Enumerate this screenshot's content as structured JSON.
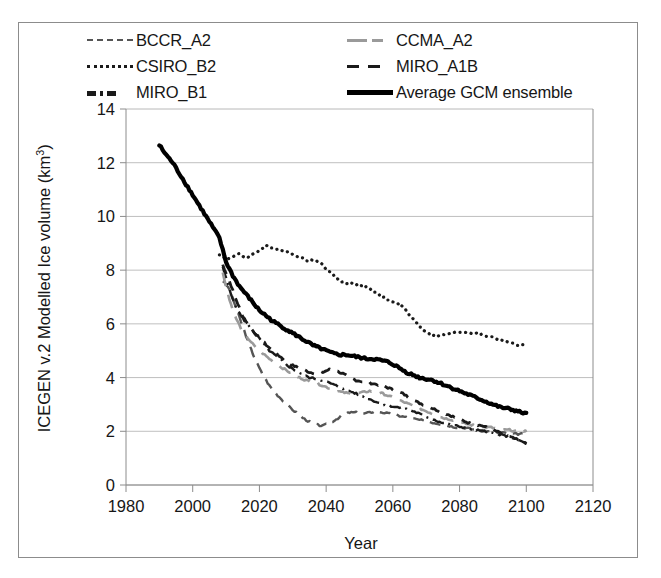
{
  "chart_data": {
    "type": "line",
    "title": "",
    "xlabel": "Year",
    "ylabel": "ICEGEN v.2 Modelled Ice volume (km3)",
    "ylabel_base": "ICEGEN v.2 Modelled Ice volume (km",
    "ylabel_sup": "3",
    "ylabel_close": ")",
    "xlim": [
      1980,
      2120
    ],
    "ylim": [
      0,
      14
    ],
    "xticks": [
      1980,
      2000,
      2020,
      2040,
      2060,
      2080,
      2100,
      2120
    ],
    "yticks": [
      0,
      2,
      4,
      6,
      8,
      10,
      12,
      14
    ],
    "grid": "horizontal",
    "legend_position": "above-plot",
    "series": [
      {
        "name": "BCCR_A2",
        "style": "long-dash",
        "color": "#555555",
        "x": [
          2009,
          2011,
          2013,
          2015,
          2017,
          2019,
          2021,
          2023,
          2025,
          2027,
          2029,
          2031,
          2033,
          2035,
          2037,
          2039,
          2041,
          2043,
          2045,
          2047,
          2049,
          2051,
          2053,
          2055,
          2057,
          2059,
          2061,
          2063,
          2065,
          2067,
          2069,
          2071,
          2073,
          2075,
          2077,
          2079,
          2081,
          2083,
          2085,
          2087,
          2089,
          2091,
          2093,
          2095,
          2097,
          2099,
          2100
        ],
        "y": [
          7.6,
          7.3,
          6.6,
          5.9,
          5.2,
          4.6,
          4.1,
          3.7,
          3.4,
          3.15,
          2.9,
          2.7,
          2.5,
          2.35,
          2.25,
          2.2,
          2.3,
          2.45,
          2.6,
          2.7,
          2.7,
          2.65,
          2.7,
          2.75,
          2.7,
          2.65,
          2.6,
          2.55,
          2.5,
          2.45,
          2.4,
          2.35,
          2.3,
          2.25,
          2.2,
          2.15,
          2.15,
          2.1,
          2.05,
          2.0,
          2.0,
          1.95,
          1.95,
          1.9,
          1.9,
          1.9,
          1.9
        ]
      },
      {
        "name": "CSIRO_B2",
        "style": "dotted",
        "color": "#1a1a1a",
        "x": [
          2008,
          2010,
          2012,
          2014,
          2016,
          2018,
          2020,
          2022,
          2024,
          2026,
          2028,
          2030,
          2032,
          2034,
          2036,
          2038,
          2040,
          2042,
          2044,
          2046,
          2048,
          2050,
          2052,
          2054,
          2056,
          2058,
          2060,
          2062,
          2064,
          2066,
          2068,
          2070,
          2072,
          2074,
          2076,
          2078,
          2080,
          2082,
          2084,
          2086,
          2088,
          2090,
          2092,
          2094,
          2096,
          2098,
          2100
        ],
        "y": [
          8.6,
          8.4,
          8.5,
          8.6,
          8.45,
          8.6,
          8.75,
          8.9,
          8.85,
          8.75,
          8.7,
          8.6,
          8.5,
          8.35,
          8.4,
          8.3,
          8.05,
          7.85,
          7.6,
          7.5,
          7.5,
          7.45,
          7.4,
          7.2,
          7.1,
          6.95,
          6.8,
          6.75,
          6.5,
          6.2,
          5.9,
          5.7,
          5.6,
          5.55,
          5.6,
          5.65,
          5.7,
          5.7,
          5.65,
          5.6,
          5.55,
          5.5,
          5.4,
          5.35,
          5.25,
          5.2,
          5.2
        ]
      },
      {
        "name": "MIRO_B1",
        "style": "dash-dot",
        "color": "#1a1a1a",
        "x": [
          2009,
          2011,
          2013,
          2015,
          2017,
          2019,
          2021,
          2023,
          2025,
          2027,
          2029,
          2031,
          2033,
          2035,
          2037,
          2039,
          2041,
          2043,
          2045,
          2047,
          2049,
          2051,
          2053,
          2055,
          2057,
          2059,
          2061,
          2063,
          2065,
          2067,
          2069,
          2071,
          2073,
          2075,
          2077,
          2079,
          2081,
          2083,
          2085,
          2087,
          2089,
          2091,
          2093,
          2095,
          2097,
          2099,
          2100
        ],
        "y": [
          8.1,
          7.3,
          6.6,
          6.2,
          5.9,
          5.6,
          5.3,
          5.0,
          4.8,
          4.6,
          4.4,
          4.25,
          4.1,
          4.0,
          3.95,
          3.9,
          3.8,
          3.7,
          3.6,
          3.5,
          3.4,
          3.3,
          3.2,
          3.1,
          3.0,
          2.95,
          2.9,
          2.85,
          2.8,
          2.7,
          2.6,
          2.5,
          2.4,
          2.3,
          2.25,
          2.2,
          2.15,
          2.1,
          2.05,
          2.0,
          1.95,
          1.9,
          1.85,
          1.8,
          1.7,
          1.6,
          1.55
        ]
      },
      {
        "name": "CCMA_A2",
        "style": "gray-long-dash",
        "color": "#9a9a9a",
        "x": [
          2009,
          2011,
          2013,
          2015,
          2017,
          2019,
          2021,
          2023,
          2025,
          2027,
          2029,
          2031,
          2033,
          2035,
          2037,
          2039,
          2041,
          2043,
          2045,
          2047,
          2049,
          2051,
          2053,
          2055,
          2057,
          2059,
          2061,
          2063,
          2065,
          2067,
          2069,
          2071,
          2073,
          2075,
          2077,
          2079,
          2081,
          2083,
          2085,
          2087,
          2089,
          2091,
          2093,
          2095,
          2097,
          2099,
          2100
        ],
        "y": [
          7.9,
          6.9,
          6.2,
          5.7,
          5.4,
          5.1,
          4.9,
          4.7,
          4.5,
          4.35,
          4.2,
          4.05,
          3.95,
          3.85,
          3.8,
          3.7,
          3.6,
          3.5,
          3.45,
          3.4,
          3.4,
          3.45,
          3.5,
          3.45,
          3.4,
          3.3,
          3.2,
          3.1,
          3.0,
          2.9,
          2.8,
          2.7,
          2.6,
          2.5,
          2.45,
          2.4,
          2.3,
          2.25,
          2.2,
          2.15,
          2.15,
          2.1,
          2.05,
          2.05,
          2.0,
          2.0,
          2.0
        ]
      },
      {
        "name": "MIRO_A1B",
        "style": "dash",
        "color": "#1a1a1a",
        "x": [
          2009,
          2011,
          2013,
          2015,
          2017,
          2019,
          2021,
          2023,
          2025,
          2027,
          2029,
          2031,
          2033,
          2035,
          2037,
          2039,
          2041,
          2043,
          2045,
          2047,
          2049,
          2051,
          2053,
          2055,
          2057,
          2059,
          2061,
          2063,
          2065,
          2067,
          2069,
          2071,
          2073,
          2075,
          2077,
          2079,
          2081,
          2083,
          2085,
          2087,
          2089,
          2091,
          2093,
          2095,
          2097,
          2099,
          2100
        ],
        "y": [
          8.2,
          7.6,
          6.9,
          6.3,
          5.9,
          5.6,
          5.35,
          5.1,
          4.9,
          4.7,
          4.5,
          4.4,
          4.3,
          4.2,
          4.15,
          4.2,
          4.3,
          4.25,
          4.15,
          4.0,
          3.9,
          3.85,
          3.8,
          3.75,
          3.7,
          3.6,
          3.5,
          3.4,
          3.25,
          3.1,
          3.0,
          2.9,
          2.8,
          2.7,
          2.6,
          2.5,
          2.4,
          2.3,
          2.25,
          2.2,
          2.1,
          2.0,
          1.9,
          1.8,
          1.7,
          1.6,
          1.55
        ]
      },
      {
        "name": "Average GCM ensemble",
        "style": "solid-thick",
        "color": "#000000",
        "x": [
          1990,
          1992,
          1994,
          1996,
          1998,
          2000,
          2002,
          2004,
          2006,
          2008,
          2010,
          2012,
          2014,
          2016,
          2018,
          2020,
          2022,
          2024,
          2026,
          2028,
          2030,
          2032,
          2034,
          2036,
          2038,
          2040,
          2042,
          2044,
          2046,
          2048,
          2050,
          2052,
          2054,
          2056,
          2058,
          2060,
          2062,
          2064,
          2066,
          2068,
          2070,
          2072,
          2074,
          2076,
          2078,
          2080,
          2082,
          2084,
          2086,
          2088,
          2090,
          2092,
          2094,
          2096,
          2098,
          2100
        ],
        "y": [
          12.65,
          12.3,
          12.0,
          11.6,
          11.2,
          10.8,
          10.4,
          10.0,
          9.6,
          9.2,
          8.3,
          7.8,
          7.4,
          7.1,
          6.8,
          6.5,
          6.3,
          6.1,
          5.95,
          5.8,
          5.65,
          5.5,
          5.35,
          5.2,
          5.1,
          5.0,
          4.9,
          4.85,
          4.85,
          4.8,
          4.75,
          4.7,
          4.7,
          4.65,
          4.6,
          4.5,
          4.35,
          4.2,
          4.1,
          4.0,
          3.95,
          3.9,
          3.8,
          3.7,
          3.6,
          3.5,
          3.4,
          3.3,
          3.2,
          3.1,
          3.0,
          2.9,
          2.85,
          2.8,
          2.72,
          2.65
        ]
      }
    ]
  },
  "legend": {
    "items": [
      {
        "label": "BCCR_A2",
        "style": "bccr"
      },
      {
        "label": "CSIRO_B2",
        "style": "csiro"
      },
      {
        "label": "MIRO_B1",
        "style": "mirob1"
      },
      {
        "label": "CCMA_A2",
        "style": "ccma"
      },
      {
        "label": "MIRO_A1B",
        "style": "miroa1b"
      },
      {
        "label": "Average GCM ensemble",
        "style": "avg"
      }
    ]
  },
  "axes": {
    "x_label": "Year",
    "x_tick_labels": [
      "1980",
      "2000",
      "2020",
      "2040",
      "2060",
      "2080",
      "2100",
      "2120"
    ],
    "y_tick_labels": [
      "0",
      "2",
      "4",
      "6",
      "8",
      "10",
      "12",
      "14"
    ]
  },
  "colors": {
    "frame": "#8c8c8c",
    "grid": "#b8b8b8",
    "ensemble": "#000000",
    "ccma": "#9a9a9a"
  }
}
